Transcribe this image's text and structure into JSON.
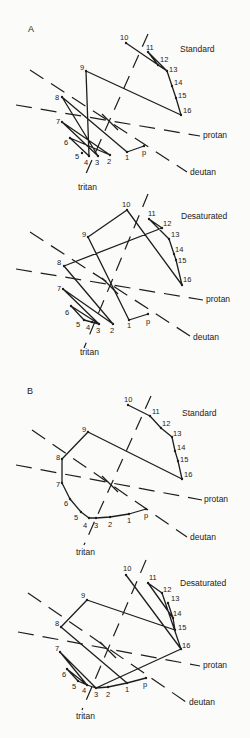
{
  "figure": {
    "panels": [
      {
        "id": "A-standard",
        "panel_label": "A",
        "title": "Standard",
        "title_pos": [
          180,
          52
        ],
        "label_pos": [
          28,
          32
        ],
        "axes": {
          "center": [
            110,
            122
          ],
          "protan": {
            "x1": 16,
            "y1": 105,
            "x2": 200,
            "y2": 136,
            "label": "protan",
            "lx": 203,
            "ly": 138
          },
          "deutan": {
            "x1": 30,
            "y1": 70,
            "x2": 187,
            "y2": 172,
            "label": "deutan",
            "lx": 190,
            "ly": 175
          },
          "tritan": {
            "x1": 148,
            "y1": 34,
            "x2": 84,
            "y2": 178,
            "label": "tritan",
            "lx": 78,
            "ly": 190
          }
        },
        "caps": [
          {
            "n": "p",
            "x": 144,
            "y": 146,
            "lx": 142,
            "ly": 155
          },
          {
            "n": "1",
            "x": 127,
            "y": 152,
            "lx": 125,
            "ly": 160
          },
          {
            "n": "2",
            "x": 110,
            "y": 155,
            "lx": 107,
            "ly": 164
          },
          {
            "n": "3",
            "x": 98,
            "y": 156,
            "lx": 95,
            "ly": 165
          },
          {
            "n": "4",
            "x": 89,
            "y": 156,
            "lx": 84,
            "ly": 165
          },
          {
            "n": "5",
            "x": 82,
            "y": 153,
            "lx": 75,
            "ly": 159
          },
          {
            "n": "6",
            "x": 70,
            "y": 138,
            "lx": 64,
            "ly": 145
          },
          {
            "n": "7",
            "x": 62,
            "y": 122,
            "lx": 56,
            "ly": 124
          },
          {
            "n": "8",
            "x": 62,
            "y": 97,
            "lx": 55,
            "ly": 100
          },
          {
            "n": "9",
            "x": 86,
            "y": 71,
            "lx": 80,
            "ly": 70
          },
          {
            "n": "10",
            "x": 126,
            "y": 43,
            "lx": 120,
            "ly": 40
          },
          {
            "n": "11",
            "x": 148,
            "y": 52,
            "lx": 146,
            "ly": 50
          },
          {
            "n": "12",
            "x": 158,
            "y": 65,
            "lx": 160,
            "ly": 62
          },
          {
            "n": "13",
            "x": 167,
            "y": 71,
            "lx": 169,
            "ly": 72
          },
          {
            "n": "14",
            "x": 172,
            "y": 86,
            "lx": 174,
            "ly": 85
          },
          {
            "n": "15",
            "x": 176,
            "y": 98,
            "lx": 178,
            "ly": 98
          },
          {
            "n": "16",
            "x": 181,
            "y": 115,
            "lx": 183,
            "ly": 113
          }
        ],
        "sequence": [
          "p",
          "1",
          "8",
          "3",
          "7",
          "2",
          "6",
          "4",
          "9",
          "16",
          "15",
          "14",
          "13",
          "12",
          "11",
          "13",
          "10"
        ]
      },
      {
        "id": "A-desaturated",
        "title": "Desaturated",
        "title_pos": [
          181,
          219
        ],
        "axes": {
          "center": [
            110,
            286
          ],
          "protan": {
            "x1": 16,
            "y1": 269,
            "x2": 203,
            "y2": 300,
            "label": "protan",
            "lx": 206,
            "ly": 302
          },
          "deutan": {
            "x1": 30,
            "y1": 232,
            "x2": 190,
            "y2": 336,
            "label": "deutan",
            "lx": 193,
            "ly": 340
          },
          "tritan": {
            "x1": 148,
            "y1": 194,
            "x2": 84,
            "y2": 348,
            "label": "tritan",
            "lx": 80,
            "ly": 355
          }
        },
        "caps": [
          {
            "n": "p",
            "x": 148,
            "y": 314,
            "lx": 146,
            "ly": 324
          },
          {
            "n": "1",
            "x": 129,
            "y": 320,
            "lx": 127,
            "ly": 328
          },
          {
            "n": "2",
            "x": 113,
            "y": 324,
            "lx": 110,
            "ly": 333
          },
          {
            "n": "3",
            "x": 99,
            "y": 324,
            "lx": 96,
            "ly": 333
          },
          {
            "n": "4",
            "x": 92,
            "y": 322,
            "lx": 86,
            "ly": 330
          },
          {
            "n": "5",
            "x": 84,
            "y": 320,
            "lx": 76,
            "ly": 327
          },
          {
            "n": "6",
            "x": 71,
            "y": 306,
            "lx": 65,
            "ly": 315
          },
          {
            "n": "7",
            "x": 63,
            "y": 289,
            "lx": 57,
            "ly": 291
          },
          {
            "n": "8",
            "x": 64,
            "y": 266,
            "lx": 57,
            "ly": 265
          },
          {
            "n": "9",
            "x": 88,
            "y": 237,
            "lx": 82,
            "ly": 237
          },
          {
            "n": "10",
            "x": 127,
            "y": 210,
            "lx": 122,
            "ly": 207
          },
          {
            "n": "11",
            "x": 149,
            "y": 219,
            "lx": 148,
            "ly": 216
          },
          {
            "n": "12",
            "x": 162,
            "y": 228,
            "lx": 163,
            "ly": 226
          },
          {
            "n": "13",
            "x": 169,
            "y": 239,
            "lx": 171,
            "ly": 237
          },
          {
            "n": "14",
            "x": 174,
            "y": 254,
            "lx": 175,
            "ly": 252
          },
          {
            "n": "15",
            "x": 176,
            "y": 260,
            "lx": 178,
            "ly": 263
          },
          {
            "n": "16",
            "x": 182,
            "y": 285,
            "lx": 183,
            "ly": 282
          }
        ],
        "sequence": [
          "p",
          "1",
          "9",
          "10",
          "16",
          "15",
          "13",
          "11",
          "12",
          "8",
          "2",
          "7",
          "3",
          "6",
          "5",
          "3"
        ]
      },
      {
        "id": "B-standard",
        "panel_label": "B",
        "title": "Standard",
        "title_pos": [
          182,
          416
        ],
        "label_pos": [
          27,
          394
        ],
        "axes": {
          "center": [
            110,
            484
          ],
          "protan": {
            "x1": 16,
            "y1": 465,
            "x2": 202,
            "y2": 500,
            "label": "protan",
            "lx": 204,
            "ly": 502
          },
          "deutan": {
            "x1": 32,
            "y1": 430,
            "x2": 187,
            "y2": 537,
            "label": "deutan",
            "lx": 190,
            "ly": 540
          },
          "tritan": {
            "x1": 151,
            "y1": 396,
            "x2": 84,
            "y2": 545,
            "label": "tritan",
            "lx": 76,
            "ly": 555
          }
        },
        "caps": [
          {
            "n": "p",
            "x": 146,
            "y": 509,
            "lx": 144,
            "ly": 518
          },
          {
            "n": "1",
            "x": 129,
            "y": 514,
            "lx": 127,
            "ly": 523
          },
          {
            "n": "2",
            "x": 110,
            "y": 517,
            "lx": 108,
            "ly": 527
          },
          {
            "n": "3",
            "x": 96,
            "y": 518,
            "lx": 94,
            "ly": 528
          },
          {
            "n": "4",
            "x": 89,
            "y": 518,
            "lx": 83,
            "ly": 528
          },
          {
            "n": "5",
            "x": 81,
            "y": 512,
            "lx": 74,
            "ly": 520
          },
          {
            "n": "6",
            "x": 70,
            "y": 499,
            "lx": 64,
            "ly": 506
          },
          {
            "n": "7",
            "x": 62,
            "y": 483,
            "lx": 56,
            "ly": 487
          },
          {
            "n": "8",
            "x": 62,
            "y": 459,
            "lx": 56,
            "ly": 460
          },
          {
            "n": "9",
            "x": 88,
            "y": 432,
            "lx": 82,
            "ly": 432
          },
          {
            "n": "10",
            "x": 128,
            "y": 405,
            "lx": 124,
            "ly": 402
          },
          {
            "n": "11",
            "x": 150,
            "y": 416,
            "lx": 152,
            "ly": 414
          },
          {
            "n": "12",
            "x": 161,
            "y": 428,
            "lx": 162,
            "ly": 426
          },
          {
            "n": "13",
            "x": 172,
            "y": 437,
            "lx": 173,
            "ly": 436
          },
          {
            "n": "14",
            "x": 175,
            "y": 451,
            "lx": 177,
            "ly": 450
          },
          {
            "n": "15",
            "x": 178,
            "y": 461,
            "lx": 180,
            "ly": 462
          },
          {
            "n": "16",
            "x": 182,
            "y": 479,
            "lx": 184,
            "ly": 477
          }
        ],
        "sequence": [
          "p",
          "1",
          "2",
          "3",
          "4",
          "5",
          "6",
          "7",
          "8",
          "9",
          "16",
          "15",
          "14",
          "15",
          "14",
          "13",
          "12",
          "11",
          "10"
        ]
      },
      {
        "id": "B-desaturated",
        "title": "Desaturated",
        "title_pos": [
          180,
          586
        ],
        "axes": {
          "center": [
            108,
            650
          ],
          "protan": {
            "x1": 18,
            "y1": 632,
            "x2": 200,
            "y2": 666,
            "label": "protan",
            "lx": 203,
            "ly": 668
          },
          "deutan": {
            "x1": 28,
            "y1": 593,
            "x2": 186,
            "y2": 702,
            "label": "deutan",
            "lx": 189,
            "ly": 705
          },
          "tritan": {
            "x1": 146,
            "y1": 560,
            "x2": 82,
            "y2": 710,
            "label": "tritan",
            "lx": 76,
            "ly": 719
          }
        },
        "caps": [
          {
            "n": "p",
            "x": 146,
            "y": 678,
            "lx": 143,
            "ly": 687
          },
          {
            "n": "1",
            "x": 127,
            "y": 683,
            "lx": 125,
            "ly": 692
          },
          {
            "n": "2",
            "x": 108,
            "y": 687,
            "lx": 106,
            "ly": 697
          },
          {
            "n": "3",
            "x": 96,
            "y": 688,
            "lx": 94,
            "ly": 697
          },
          {
            "n": "4",
            "x": 87,
            "y": 685,
            "lx": 82,
            "ly": 693
          },
          {
            "n": "5",
            "x": 78,
            "y": 681,
            "lx": 72,
            "ly": 689
          },
          {
            "n": "6",
            "x": 67,
            "y": 669,
            "lx": 62,
            "ly": 677
          },
          {
            "n": "7",
            "x": 60,
            "y": 652,
            "lx": 55,
            "ly": 651
          },
          {
            "n": "8",
            "x": 61,
            "y": 627,
            "lx": 55,
            "ly": 626
          },
          {
            "n": "9",
            "x": 87,
            "y": 600,
            "lx": 81,
            "ly": 598
          },
          {
            "n": "10",
            "x": 126,
            "y": 575,
            "lx": 123,
            "ly": 571
          },
          {
            "n": "11",
            "x": 148,
            "y": 583,
            "lx": 149,
            "ly": 580
          },
          {
            "n": "12",
            "x": 162,
            "y": 593,
            "lx": 163,
            "ly": 592
          },
          {
            "n": "13",
            "x": 168,
            "y": 603,
            "lx": 171,
            "ly": 601
          },
          {
            "n": "14",
            "x": 173,
            "y": 618,
            "lx": 173,
            "ly": 616
          },
          {
            "n": "15",
            "x": 175,
            "y": 630,
            "lx": 178,
            "ly": 630
          },
          {
            "n": "16",
            "x": 181,
            "y": 649,
            "lx": 182,
            "ly": 648
          }
        ],
        "sequence": [
          "p",
          "1",
          "8",
          "9",
          "15",
          "14",
          "13",
          "14",
          "11",
          "12",
          "16",
          "10",
          "16",
          "3",
          "7",
          "4",
          "6",
          "5",
          "4",
          "3",
          "2",
          "1"
        ]
      }
    ]
  },
  "style": {
    "ink": "#1e1e1e",
    "paper": "#fbfbf9"
  }
}
